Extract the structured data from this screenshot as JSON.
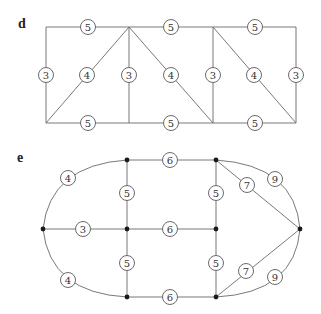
{
  "panels": [
    {
      "id": "d",
      "letter": "d",
      "letter_pos": [
        18,
        28
      ],
      "vertices": [],
      "edges": [
        {
          "type": "line",
          "from": [
            46,
            27
          ],
          "to": [
            129,
            27
          ]
        },
        {
          "type": "line",
          "from": [
            129,
            27
          ],
          "to": [
            213,
            27
          ]
        },
        {
          "type": "line",
          "from": [
            213,
            27
          ],
          "to": [
            296,
            27
          ]
        },
        {
          "type": "line",
          "from": [
            46,
            123
          ],
          "to": [
            129,
            123
          ]
        },
        {
          "type": "line",
          "from": [
            129,
            123
          ],
          "to": [
            213,
            123
          ]
        },
        {
          "type": "line",
          "from": [
            213,
            123
          ],
          "to": [
            296,
            123
          ]
        },
        {
          "type": "line",
          "from": [
            46,
            27
          ],
          "to": [
            46,
            123
          ]
        },
        {
          "type": "line",
          "from": [
            129,
            27
          ],
          "to": [
            129,
            123
          ]
        },
        {
          "type": "line",
          "from": [
            213,
            27
          ],
          "to": [
            213,
            123
          ]
        },
        {
          "type": "line",
          "from": [
            296,
            27
          ],
          "to": [
            296,
            123
          ]
        },
        {
          "type": "line",
          "from": [
            129,
            27
          ],
          "to": [
            46,
            123
          ]
        },
        {
          "type": "line",
          "from": [
            129,
            27
          ],
          "to": [
            213,
            123
          ]
        },
        {
          "type": "line",
          "from": [
            213,
            27
          ],
          "to": [
            296,
            123
          ]
        }
      ],
      "weights": [
        {
          "value": "5",
          "pos": [
            88,
            27
          ]
        },
        {
          "value": "5",
          "pos": [
            171,
            27
          ]
        },
        {
          "value": "5",
          "pos": [
            255,
            27
          ]
        },
        {
          "value": "3",
          "pos": [
            46,
            75
          ]
        },
        {
          "value": "4",
          "pos": [
            87,
            75
          ]
        },
        {
          "value": "3",
          "pos": [
            129,
            75
          ]
        },
        {
          "value": "4",
          "pos": [
            171,
            75
          ]
        },
        {
          "value": "3",
          "pos": [
            213,
            75
          ]
        },
        {
          "value": "4",
          "pos": [
            254,
            75
          ]
        },
        {
          "value": "3",
          "pos": [
            296,
            75
          ]
        },
        {
          "value": "5",
          "pos": [
            88,
            123
          ]
        },
        {
          "value": "5",
          "pos": [
            171,
            123
          ]
        },
        {
          "value": "5",
          "pos": [
            255,
            123
          ]
        }
      ]
    },
    {
      "id": "e",
      "letter": "e",
      "letter_pos": [
        17,
        162
      ],
      "vertices": [
        [
          43,
          229
        ],
        [
          127,
          160
        ],
        [
          127,
          229
        ],
        [
          127,
          297
        ],
        [
          216,
          160
        ],
        [
          216,
          229
        ],
        [
          216,
          297
        ],
        [
          300,
          229
        ]
      ],
      "edges": [
        {
          "type": "path",
          "d": "M 43 229 Q 50 165 127 160"
        },
        {
          "type": "path",
          "d": "M 43 229 Q 50 293 127 297"
        },
        {
          "type": "line",
          "from": [
            43,
            229
          ],
          "to": [
            127,
            229
          ]
        },
        {
          "type": "line",
          "from": [
            127,
            160
          ],
          "to": [
            216,
            160
          ]
        },
        {
          "type": "line",
          "from": [
            127,
            229
          ],
          "to": [
            216,
            229
          ]
        },
        {
          "type": "line",
          "from": [
            127,
            297
          ],
          "to": [
            216,
            297
          ]
        },
        {
          "type": "line",
          "from": [
            127,
            160
          ],
          "to": [
            127,
            297
          ]
        },
        {
          "type": "line",
          "from": [
            216,
            160
          ],
          "to": [
            216,
            297
          ]
        },
        {
          "type": "line",
          "from": [
            216,
            160
          ],
          "to": [
            300,
            229
          ]
        },
        {
          "type": "line",
          "from": [
            216,
            297
          ],
          "to": [
            300,
            229
          ]
        },
        {
          "type": "path",
          "d": "M 216 160 Q 295 165 300 229"
        },
        {
          "type": "path",
          "d": "M 216 297 Q 295 293 300 229"
        }
      ],
      "weights": [
        {
          "value": "4",
          "pos": [
            68,
            178
          ]
        },
        {
          "value": "4",
          "pos": [
            68,
            280
          ]
        },
        {
          "value": "3",
          "pos": [
            83,
            229
          ]
        },
        {
          "value": "6",
          "pos": [
            170,
            160
          ]
        },
        {
          "value": "6",
          "pos": [
            170,
            229
          ]
        },
        {
          "value": "6",
          "pos": [
            170,
            297
          ]
        },
        {
          "value": "5",
          "pos": [
            127,
            193
          ]
        },
        {
          "value": "5",
          "pos": [
            127,
            263
          ]
        },
        {
          "value": "5",
          "pos": [
            216,
            193
          ]
        },
        {
          "value": "5",
          "pos": [
            216,
            263
          ]
        },
        {
          "value": "7",
          "pos": [
            247,
            185
          ]
        },
        {
          "value": "7",
          "pos": [
            246,
            271
          ]
        },
        {
          "value": "9",
          "pos": [
            275,
            179
          ]
        },
        {
          "value": "9",
          "pos": [
            275,
            277
          ]
        }
      ]
    }
  ],
  "style": {
    "edge_color": "#6a6a6a",
    "vertex_color": "#1a1a1a",
    "circle_radius": 7.5,
    "vertex_radius": 2.4
  }
}
